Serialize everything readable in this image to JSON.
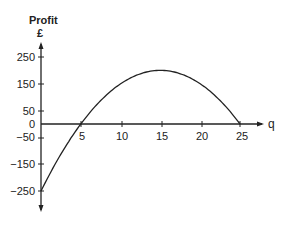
{
  "chart_data": {
    "type": "line",
    "title": "",
    "ylabel": "Profit",
    "yunit": "£",
    "xlabel": "q",
    "xlim": [
      0,
      25
    ],
    "ylim": [
      -250,
      250
    ],
    "x_ticks": [
      5,
      10,
      15,
      20,
      25
    ],
    "y_ticks": [
      250,
      150,
      50,
      0,
      -50,
      -150,
      -250
    ],
    "grid": false,
    "legend": null,
    "series": [
      {
        "name": "Profit curve",
        "equation": "P = -2q^2 + 60q - 250",
        "x": [
          0,
          2.5,
          5,
          7.5,
          10,
          12.5,
          15,
          17.5,
          20,
          22.5,
          25
        ],
        "values": [
          -250,
          -112.5,
          0,
          87.5,
          150,
          187.5,
          200,
          187.5,
          150,
          87.5,
          0
        ]
      }
    ]
  },
  "axis": {
    "y_title": "Profit",
    "y_unit": "£",
    "x_title": "q",
    "y_tick_labels": [
      "250",
      "150",
      "50",
      "0",
      "−50",
      "−150",
      "−250"
    ],
    "x_tick_labels": [
      "5",
      "10",
      "15",
      "20",
      "25"
    ]
  }
}
